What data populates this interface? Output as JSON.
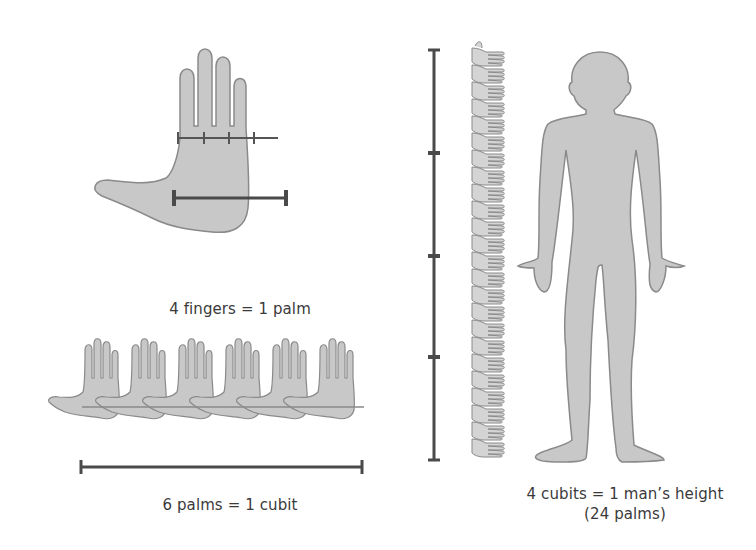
{
  "diagram": {
    "colors": {
      "fill": "#c8c8c8",
      "outline": "#8a8a8a",
      "measure_bar": "#4a4a4a",
      "text": "#3a3a3a"
    },
    "panels": {
      "hand": {
        "caption": "4 fingers = 1 palm",
        "finger_count": 4
      },
      "cubit": {
        "caption": "6 palms = 1 cubit",
        "palm_count": 6
      },
      "man": {
        "caption_line1": "4 cubits = 1 man’s height",
        "caption_line2": "(24 palms)",
        "cubit_segments": 4,
        "palm_stack_count": 24
      }
    }
  }
}
